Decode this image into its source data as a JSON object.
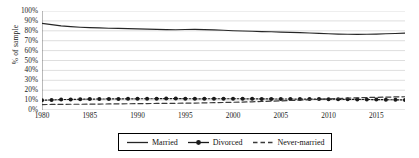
{
  "chart_data": {
    "type": "line",
    "title": "",
    "xlabel": "",
    "ylabel": "% of sample",
    "xlim": [
      1980,
      2018
    ],
    "ylim": [
      0,
      100
    ],
    "grid": true,
    "legend_position": "bottom",
    "x": [
      1980,
      1981,
      1982,
      1983,
      1984,
      1985,
      1986,
      1987,
      1988,
      1989,
      1990,
      1991,
      1992,
      1993,
      1994,
      1995,
      1996,
      1997,
      1998,
      1999,
      2000,
      2001,
      2002,
      2003,
      2004,
      2005,
      2006,
      2007,
      2008,
      2009,
      2010,
      2011,
      2012,
      2013,
      2014,
      2015,
      2016,
      2017,
      2018
    ],
    "xticks": [
      1980,
      1985,
      1990,
      1995,
      2000,
      2005,
      2010,
      2015
    ],
    "yticks": [
      0,
      10,
      20,
      30,
      40,
      50,
      60,
      70,
      80,
      90,
      100
    ],
    "ytick_labels": [
      "0%",
      "10%",
      "20%",
      "30%",
      "40%",
      "50%",
      "60%",
      "70%",
      "80%",
      "90%",
      "100%"
    ],
    "series": [
      {
        "name": "Married",
        "style": "solid",
        "marker": "none",
        "color": "#262626",
        "values": [
          87.5,
          86.2,
          85.0,
          84.2,
          83.6,
          83.2,
          82.9,
          82.6,
          82.4,
          82.2,
          82.0,
          81.7,
          81.4,
          81.2,
          81.1,
          81.3,
          81.4,
          81.2,
          80.9,
          80.5,
          80.1,
          79.8,
          79.5,
          79.2,
          79.0,
          78.7,
          78.4,
          78.1,
          77.8,
          77.4,
          77.0,
          76.7,
          76.5,
          76.4,
          76.5,
          76.7,
          77.0,
          77.3,
          77.6
        ]
      },
      {
        "name": "Divorced",
        "style": "dotted",
        "marker": "circle",
        "color": "#1a1a1a",
        "values": [
          9.8,
          10.2,
          10.5,
          10.7,
          10.9,
          11.0,
          11.1,
          11.2,
          11.2,
          11.3,
          11.3,
          11.4,
          11.4,
          11.5,
          11.5,
          11.4,
          11.3,
          11.3,
          11.4,
          11.4,
          11.4,
          11.3,
          11.3,
          11.2,
          11.2,
          11.1,
          11.1,
          11.0,
          11.0,
          11.0,
          10.9,
          10.8,
          10.8,
          10.7,
          10.6,
          10.5,
          10.4,
          10.3,
          10.2
        ]
      },
      {
        "name": "Never-married",
        "style": "dashed",
        "marker": "none",
        "color": "#3a3a3a",
        "values": [
          5.5,
          5.6,
          5.7,
          5.8,
          5.8,
          5.9,
          6.0,
          6.1,
          6.2,
          6.3,
          6.4,
          6.5,
          6.6,
          6.7,
          6.8,
          6.9,
          7.0,
          7.2,
          7.4,
          7.6,
          7.8,
          8.0,
          8.3,
          8.6,
          8.9,
          9.2,
          9.6,
          10.0,
          10.4,
          10.8,
          11.2,
          11.6,
          12.0,
          12.3,
          12.6,
          12.8,
          13.0,
          13.2,
          13.4
        ]
      }
    ]
  },
  "legend": {
    "items": [
      {
        "label": "Married",
        "key": "solid-line-key"
      },
      {
        "label": "Divorced",
        "key": "dotted-marker-line-key"
      },
      {
        "label": "Never-married",
        "key": "dashed-line-key"
      }
    ]
  }
}
